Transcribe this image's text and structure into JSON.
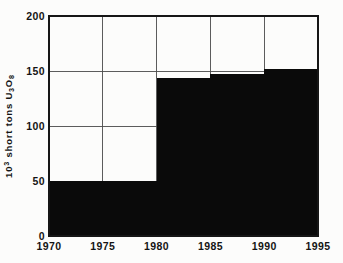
{
  "figure": {
    "background": "#fcfcfb",
    "ink_color": "#141414",
    "grid_color": "#4a4a4a",
    "border_color": "#161616"
  },
  "chart_data": {
    "type": "area",
    "subtype": "step-filled",
    "title": "",
    "xlabel": "",
    "ylabel": "10^3 short tons U3O8",
    "ylabel_parts": [
      {
        "t": "10"
      },
      {
        "t": "3",
        "pos": "sup"
      },
      {
        "t": " short tons U"
      },
      {
        "t": "3",
        "pos": "sub"
      },
      {
        "t": "O"
      },
      {
        "t": "8",
        "pos": "sub"
      }
    ],
    "xlim": [
      1970,
      1995
    ],
    "ylim": [
      0,
      200
    ],
    "x_ticks": [
      1970,
      1975,
      1980,
      1985,
      1990,
      1995
    ],
    "y_ticks": [
      0,
      50,
      100,
      150,
      200
    ],
    "grid": true,
    "legend": "none",
    "fill_color": "#0a0a0a",
    "steps": [
      {
        "x_start": 1970,
        "x_end": 1980,
        "value": 50
      },
      {
        "x_start": 1980,
        "x_end": 1985,
        "value": 144
      },
      {
        "x_start": 1985,
        "x_end": 1990,
        "value": 147
      },
      {
        "x_start": 1990,
        "x_end": 1995,
        "value": 152
      }
    ]
  }
}
